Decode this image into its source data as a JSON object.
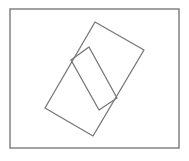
{
  "canvas": {
    "width": 189,
    "height": 161,
    "background": "#ffffff"
  },
  "style": {
    "stroke": "#777777",
    "frame_stroke": "#7a7a7a",
    "stroke_width": 1.3
  },
  "frame": {
    "x": 10,
    "y": 9,
    "width": 169,
    "height": 139
  },
  "shapes": [
    {
      "name": "large-rotated-rectangle",
      "points": [
        [
          95,
          22
        ],
        [
          144,
          50
        ],
        [
          93,
          136
        ],
        [
          45,
          108
        ]
      ]
    },
    {
      "name": "small-rotated-rectangle",
      "points": [
        [
          89,
          47
        ],
        [
          117,
          98
        ],
        [
          99,
          110
        ],
        [
          71,
          60
        ]
      ]
    }
  ]
}
